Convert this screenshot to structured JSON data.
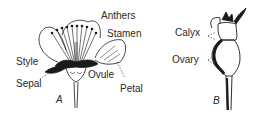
{
  "diagram": {
    "figure_a": {
      "id_label": "A",
      "labels": {
        "anthers": "Anthers",
        "stamen": "Stamen",
        "style": "Style",
        "sepal": "Sepal",
        "ovule": "Ovule",
        "petal": "Petal"
      }
    },
    "figure_b": {
      "id_label": "B",
      "labels": {
        "calyx": "Calyx",
        "ovary": "Ovary"
      }
    },
    "colors": {
      "ink": "#1a1a1a",
      "background": "#ffffff"
    }
  }
}
